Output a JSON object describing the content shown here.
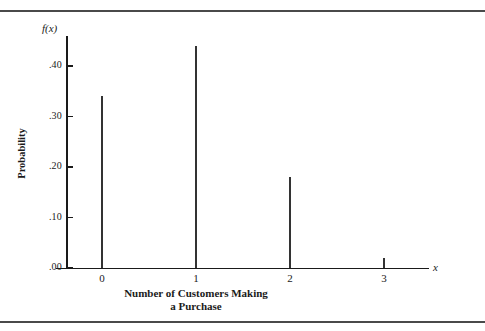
{
  "figure": {
    "background_color": "#ffffff",
    "rule_color": "#4a4a4a",
    "axis_color": "#1a1a1a",
    "spike_color": "#333333"
  },
  "chart_data": {
    "type": "bar",
    "title": "",
    "subtitle": "",
    "categories": [
      "0",
      "1",
      "2",
      "3"
    ],
    "x": [
      0,
      1,
      2,
      3
    ],
    "values": [
      0.34,
      0.44,
      0.18,
      0.02
    ],
    "xlabel": "Number of Customers Making a Purchase",
    "xlabel_line1": "Number of Customers Making",
    "xlabel_line2": "a Purchase",
    "ylabel": "Probability",
    "y_axis_symbol": "f(x)",
    "x_axis_symbol": "x",
    "ylim": [
      0.0,
      0.46
    ],
    "xlim": [
      -0.55,
      3.5
    ],
    "ytick_labels": [
      ".40",
      ".30",
      ".20",
      ".10",
      ".00"
    ],
    "ytick_values": [
      0.4,
      0.3,
      0.2,
      0.1,
      0.0
    ],
    "xtick_labels": [
      "0",
      "1",
      "2",
      "3"
    ],
    "grid": false,
    "legend": false,
    "legend_position": "none"
  }
}
